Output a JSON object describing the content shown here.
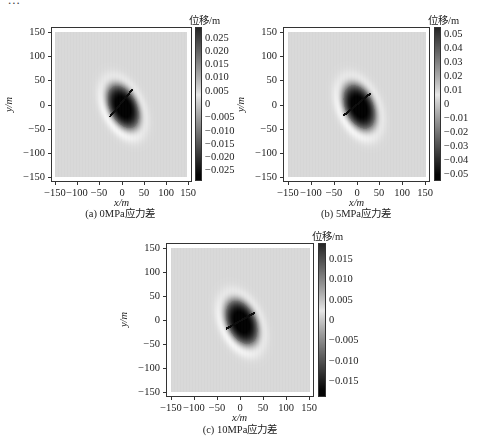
{
  "header_fragment": "...",
  "chart_data": [
    {
      "type": "heatmap",
      "id": "a",
      "title": "",
      "caption": "(a)  0MPa应力差",
      "xlabel": "x/m",
      "ylabel": "y/m",
      "xlim": [
        -160,
        160
      ],
      "ylim": [
        -160,
        160
      ],
      "xticks": [
        -150,
        -100,
        -50,
        0,
        50,
        100,
        150
      ],
      "yticks": [
        150,
        100,
        50,
        0,
        -50,
        -100,
        -150
      ],
      "xtick_labels": [
        "−150",
        "−100",
        "−50",
        "0",
        "50",
        "100",
        "150"
      ],
      "ytick_labels": [
        "150",
        "100",
        "50",
        "0",
        "−50",
        "−100",
        "−150"
      ],
      "colorbar": {
        "title": "位移/m",
        "range": [
          -0.029,
          0.029
        ],
        "ticks": [
          0.025,
          0.02,
          0.015,
          0.01,
          0.005,
          0,
          -0.005,
          -0.01,
          -0.015,
          -0.02,
          -0.025
        ],
        "tick_labels": [
          "0.025",
          "0.020",
          "0.015",
          "0.010",
          "0.005",
          "0",
          "−0.005",
          "−0.010",
          "−0.015",
          "−0.020",
          "−0.025"
        ]
      },
      "field": {
        "description": "displacement field around inclined crack, two dark lobes along NW-SE axis",
        "crack_endpoints_m": [
          [
            -25,
            -25
          ],
          [
            25,
            30
          ]
        ],
        "lobe_centers_m": [
          [
            -10,
            20
          ],
          [
            20,
            -30
          ]
        ],
        "peak_abs_displacement": 0.028
      }
    },
    {
      "type": "heatmap",
      "id": "b",
      "title": "",
      "caption": "(b)  5MPa应力差",
      "xlabel": "x/m",
      "ylabel": "y/m",
      "xlim": [
        -160,
        160
      ],
      "ylim": [
        -160,
        160
      ],
      "xticks": [
        -150,
        -100,
        -50,
        0,
        50,
        100,
        150
      ],
      "yticks": [
        150,
        100,
        50,
        0,
        -50,
        -100,
        -150
      ],
      "xtick_labels": [
        "−150",
        "−100",
        "−50",
        "0",
        "50",
        "100",
        "150"
      ],
      "ytick_labels": [
        "150",
        "100",
        "50",
        "0",
        "−50",
        "−100",
        "−150"
      ],
      "colorbar": {
        "title": "位移/m",
        "range": [
          -0.055,
          0.055
        ],
        "ticks": [
          0.05,
          0.04,
          0.03,
          0.02,
          0.01,
          0,
          -0.01,
          -0.02,
          -0.03,
          -0.04,
          -0.05
        ],
        "tick_labels": [
          "0.05",
          "0.04",
          "0.03",
          "0.02",
          "0.01",
          "0",
          "−0.01",
          "−0.02",
          "−0.03",
          "−0.04",
          "−0.05"
        ]
      },
      "field": {
        "description": "displacement field, single dark elongated region along crack",
        "crack_endpoints_m": [
          [
            -28,
            -22
          ],
          [
            28,
            22
          ]
        ],
        "lobe_centers_m": [
          [
            -5,
            15
          ],
          [
            15,
            -25
          ]
        ],
        "peak_abs_displacement": 0.052
      }
    },
    {
      "type": "heatmap",
      "id": "c",
      "title": "",
      "caption": "(c)  10MPa应力差",
      "xlabel": "x/m",
      "ylabel": "y/m",
      "xlim": [
        -160,
        160
      ],
      "ylim": [
        -160,
        160
      ],
      "xticks": [
        -150,
        -100,
        -50,
        0,
        50,
        100,
        150
      ],
      "yticks": [
        150,
        100,
        50,
        0,
        -50,
        -100,
        -150
      ],
      "xtick_labels": [
        "−150",
        "−100",
        "−50",
        "0",
        "50",
        "100",
        "150"
      ],
      "ytick_labels": [
        "150",
        "100",
        "50",
        "0",
        "−50",
        "−100",
        "−150"
      ],
      "colorbar": {
        "title": "位移/m",
        "range": [
          -0.019,
          0.019
        ],
        "ticks": [
          0.015,
          0.01,
          0.005,
          0,
          -0.005,
          -0.01,
          -0.015
        ],
        "tick_labels": [
          "0.015",
          "0.010",
          "0.005",
          "0",
          "−0.005",
          "−0.010",
          "−0.015"
        ]
      },
      "field": {
        "description": "displacement field, dark elongated region, crack nearly horizontal-inclined",
        "crack_endpoints_m": [
          [
            -30,
            -18
          ],
          [
            30,
            15
          ]
        ],
        "lobe_centers_m": [
          [
            -5,
            10
          ],
          [
            10,
            -20
          ]
        ],
        "peak_abs_displacement": 0.018
      }
    }
  ]
}
